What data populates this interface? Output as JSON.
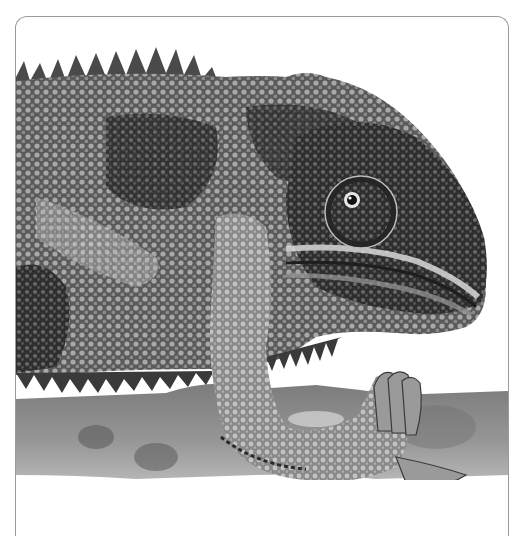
{
  "image": {
    "subject": "chameleon",
    "style": "grayscale illustration",
    "elements": [
      "chameleon-head",
      "chameleon-eye",
      "dorsal-crest",
      "body",
      "front-leg",
      "gripping-foot",
      "branch"
    ],
    "colors": {
      "background": "#ffffff",
      "border": "#9a9a9a",
      "dark_tone": "#2a2a2a",
      "mid_tone": "#6e6e6e",
      "light_tone": "#b8b8b8",
      "branch_tone": "#8a8a8a"
    }
  },
  "card": {
    "caption": ""
  }
}
